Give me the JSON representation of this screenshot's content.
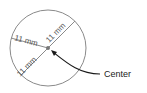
{
  "diagram": {
    "type": "circle-radius-diagram",
    "labels": {
      "radius_top_left": "11 mm",
      "radius_top_right": "11 mm",
      "radius_bottom_left": "11 mm",
      "center_callout": "Center"
    },
    "colors": {
      "circle": "#8a8a8a",
      "lines": "#8a8a8a",
      "center_dot": "#777777",
      "arrow": "#1a1a1a",
      "text": "#555555"
    }
  }
}
